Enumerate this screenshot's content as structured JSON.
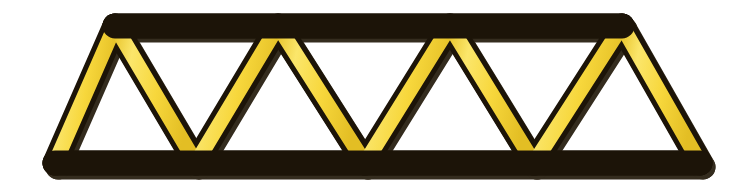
{
  "canvas": {
    "width": 738,
    "height": 192,
    "background_color": "#ffffff",
    "title": "Yellow craft-stick Warren truss bridge"
  },
  "colors": {
    "stick_fill": "#F7D73C",
    "stick_fill_highlight": "#FBE66B",
    "stick_fill_shade": "#E8C42A",
    "stick_outline": "#1C1408",
    "shadow": "#2A2112",
    "background": "#ffffff"
  },
  "style": {
    "stick_thickness": 15,
    "outline_thickness": 5,
    "cap": "round",
    "shadow_offset_x": 3,
    "shadow_offset_y": 4
  },
  "geometry": {
    "top_chord_y": 26,
    "bottom_chord_y": 163,
    "top_nodes_x": [
      115,
      278,
      450,
      622
    ],
    "bottom_nodes_x": [
      55,
      196,
      365,
      534,
      700
    ]
  },
  "chart_data": {
    "type": "diagram",
    "panel_count": 4,
    "members": [
      {
        "name": "top-chord",
        "kind": "chord",
        "x1": 115,
        "y1": 26,
        "x2": 622,
        "y2": 26
      },
      {
        "name": "bottom-chord",
        "kind": "chord",
        "x1": 55,
        "y1": 163,
        "x2": 700,
        "y2": 163
      },
      {
        "name": "diagonal-1",
        "kind": "diagonal",
        "x1": 55,
        "y1": 163,
        "x2": 115,
        "y2": 26
      },
      {
        "name": "diagonal-2",
        "kind": "diagonal",
        "x1": 115,
        "y1": 26,
        "x2": 196,
        "y2": 163
      },
      {
        "name": "diagonal-3",
        "kind": "diagonal",
        "x1": 196,
        "y1": 163,
        "x2": 278,
        "y2": 26
      },
      {
        "name": "diagonal-4",
        "kind": "diagonal",
        "x1": 278,
        "y1": 26,
        "x2": 365,
        "y2": 163
      },
      {
        "name": "diagonal-5",
        "kind": "diagonal",
        "x1": 365,
        "y1": 163,
        "x2": 450,
        "y2": 26
      },
      {
        "name": "diagonal-6",
        "kind": "diagonal",
        "x1": 450,
        "y1": 26,
        "x2": 534,
        "y2": 163
      },
      {
        "name": "diagonal-7",
        "kind": "diagonal",
        "x1": 534,
        "y1": 163,
        "x2": 622,
        "y2": 26
      },
      {
        "name": "diagonal-8",
        "kind": "diagonal",
        "x1": 622,
        "y1": 26,
        "x2": 700,
        "y2": 163
      }
    ],
    "nodes": [
      {
        "name": "node-bottom-left",
        "x": 55,
        "y": 163
      },
      {
        "name": "node-top-1",
        "x": 115,
        "y": 26
      },
      {
        "name": "node-bottom-1",
        "x": 196,
        "y": 163
      },
      {
        "name": "node-top-2",
        "x": 278,
        "y": 26
      },
      {
        "name": "node-bottom-2",
        "x": 365,
        "y": 163
      },
      {
        "name": "node-top-3",
        "x": 450,
        "y": 26
      },
      {
        "name": "node-bottom-3",
        "x": 534,
        "y": 163
      },
      {
        "name": "node-top-4",
        "x": 622,
        "y": 26
      },
      {
        "name": "node-bottom-right",
        "x": 700,
        "y": 163
      }
    ]
  },
  "labels": {
    "figure_caption": ""
  }
}
